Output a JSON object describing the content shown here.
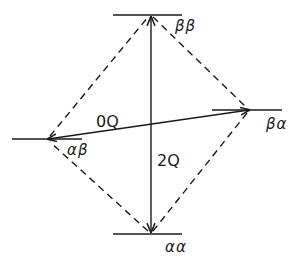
{
  "diagram": {
    "type": "energy-level-diagram",
    "line_color": "#1a1a1a",
    "levels": [
      {
        "id": "beta-beta",
        "label": "ββ",
        "position": "top"
      },
      {
        "id": "beta-alpha",
        "label": "βα",
        "position": "right"
      },
      {
        "id": "alpha-beta",
        "label": "αβ",
        "position": "left"
      },
      {
        "id": "alpha-alpha",
        "label": "αα",
        "position": "bottom"
      }
    ],
    "transitions": [
      {
        "id": "zero-quantum",
        "label": "0Q",
        "from": "αβ",
        "to": "βα",
        "style": "solid",
        "arrows": "both"
      },
      {
        "id": "double-quantum",
        "label": "2Q",
        "from": "αα",
        "to": "ββ",
        "style": "solid",
        "arrows": "both"
      }
    ],
    "single_quantum_paths": {
      "style": "dashed",
      "edges": [
        "ββ-βα",
        "βα-αα",
        "αα-αβ",
        "αβ-ββ"
      ]
    }
  }
}
